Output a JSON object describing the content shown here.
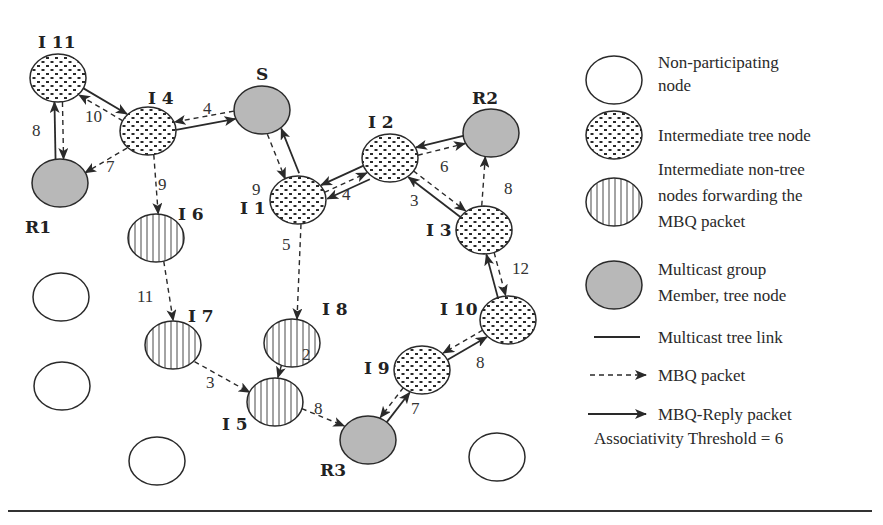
{
  "diagram": {
    "colors": {
      "stroke": "#2a2a2a",
      "member_fill": "#b8b8b8",
      "blank_fill": "#ffffff",
      "background": "#ffffff"
    },
    "nodes": [
      {
        "id": "I11",
        "label": "I 11",
        "type": "tree",
        "x": 58,
        "y": 78,
        "lx": 38,
        "ly": 48
      },
      {
        "id": "R1",
        "label": "R1",
        "type": "member",
        "x": 60,
        "y": 183,
        "lx": 25,
        "ly": 233
      },
      {
        "id": "I4",
        "label": "I 4",
        "type": "tree",
        "x": 148,
        "y": 131,
        "lx": 148,
        "ly": 104
      },
      {
        "id": "S",
        "label": "S",
        "type": "member",
        "x": 262,
        "y": 110,
        "lx": 256,
        "ly": 80
      },
      {
        "id": "I1",
        "label": "I 1",
        "type": "tree",
        "x": 298,
        "y": 200,
        "lx": 240,
        "ly": 214
      },
      {
        "id": "I2",
        "label": "I 2",
        "type": "tree",
        "x": 390,
        "y": 158,
        "lx": 368,
        "ly": 128
      },
      {
        "id": "R2",
        "label": "R2",
        "type": "member",
        "x": 491,
        "y": 133,
        "lx": 472,
        "ly": 104
      },
      {
        "id": "I3",
        "label": "I 3",
        "type": "tree",
        "x": 484,
        "y": 230,
        "lx": 426,
        "ly": 236
      },
      {
        "id": "I6",
        "label": "I 6",
        "type": "nontree",
        "x": 156,
        "y": 238,
        "lx": 178,
        "ly": 220
      },
      {
        "id": "I7",
        "label": "I 7",
        "type": "nontree",
        "x": 173,
        "y": 345,
        "lx": 188,
        "ly": 322
      },
      {
        "id": "I8",
        "label": "I 8",
        "type": "nontree",
        "x": 292,
        "y": 343,
        "lx": 322,
        "ly": 315
      },
      {
        "id": "I5",
        "label": "I 5",
        "type": "nontree",
        "x": 275,
        "y": 402,
        "lx": 222,
        "ly": 430
      },
      {
        "id": "I9",
        "label": "I 9",
        "type": "tree",
        "x": 422,
        "y": 370,
        "lx": 364,
        "ly": 374
      },
      {
        "id": "I10",
        "label": "I 10",
        "type": "tree",
        "x": 508,
        "y": 320,
        "lx": 440,
        "ly": 315
      },
      {
        "id": "R3",
        "label": "R3",
        "type": "member",
        "x": 368,
        "y": 440,
        "lx": 320,
        "ly": 476
      },
      {
        "id": "N1",
        "label": "",
        "type": "blank",
        "x": 61,
        "y": 297
      },
      {
        "id": "N2",
        "label": "",
        "type": "blank",
        "x": 62,
        "y": 386
      },
      {
        "id": "N3",
        "label": "",
        "type": "blank",
        "x": 157,
        "y": 461
      },
      {
        "id": "N4",
        "label": "",
        "type": "blank",
        "x": 497,
        "y": 457
      }
    ],
    "edges": [
      {
        "from": "I11",
        "to": "R1",
        "kind": "mbq",
        "label": "8",
        "lx": 32,
        "ly": 136
      },
      {
        "from": "R1",
        "to": "I11",
        "kind": "reply",
        "label": ""
      },
      {
        "from": "I11",
        "to": "I4",
        "kind": "reply",
        "label": ""
      },
      {
        "from": "I4",
        "to": "I11",
        "kind": "mbq",
        "label": "10",
        "lx": 85,
        "ly": 122
      },
      {
        "from": "S",
        "to": "I4",
        "kind": "mbq",
        "label": "4",
        "lx": 203,
        "ly": 114
      },
      {
        "from": "I4",
        "to": "S",
        "kind": "reply",
        "label": ""
      },
      {
        "from": "I4",
        "to": "R1",
        "kind": "mbq",
        "label": "7",
        "lx": 106,
        "ly": 172
      },
      {
        "from": "I4",
        "to": "I6",
        "kind": "mbq",
        "label": "9",
        "lx": 158,
        "ly": 190
      },
      {
        "from": "S",
        "to": "I1",
        "kind": "mbq",
        "label": "9",
        "lx": 252,
        "ly": 195
      },
      {
        "from": "I1",
        "to": "S",
        "kind": "reply2",
        "label": ""
      },
      {
        "from": "I2",
        "to": "I1",
        "kind": "reply",
        "label": ""
      },
      {
        "from": "I1",
        "to": "I2",
        "kind": "mbq",
        "label": "4",
        "lx": 342,
        "ly": 200
      },
      {
        "from": "I2",
        "to": "I1",
        "kind": "reply",
        "label": ""
      },
      {
        "from": "R2",
        "to": "I2",
        "kind": "reply",
        "label": ""
      },
      {
        "from": "I2",
        "to": "R2",
        "kind": "mbq",
        "label": "6",
        "lx": 440,
        "ly": 172
      },
      {
        "from": "I2",
        "to": "I3",
        "kind": "mbq",
        "label": "3",
        "lx": 410,
        "ly": 206
      },
      {
        "from": "I3",
        "to": "I2",
        "kind": "reply",
        "label": ""
      },
      {
        "from": "I3",
        "to": "R2",
        "kind": "mbq",
        "label": "8",
        "lx": 504,
        "ly": 194
      },
      {
        "from": "I10",
        "to": "I3",
        "kind": "reply",
        "label": ""
      },
      {
        "from": "I3",
        "to": "I10",
        "kind": "mbq",
        "label": "12",
        "lx": 512,
        "ly": 274
      },
      {
        "from": "I1",
        "to": "I8",
        "kind": "mbq",
        "label": "5",
        "lx": 282,
        "ly": 250
      },
      {
        "from": "I6",
        "to": "I7",
        "kind": "mbq",
        "label": "11",
        "lx": 137,
        "ly": 302
      },
      {
        "from": "I7",
        "to": "I5",
        "kind": "mbq",
        "label": "3",
        "lx": 206,
        "ly": 388
      },
      {
        "from": "I8",
        "to": "I5",
        "kind": "mbq",
        "label": "2",
        "lx": 302,
        "ly": 360
      },
      {
        "from": "I5",
        "to": "R3",
        "kind": "mbq",
        "label": "8",
        "lx": 314,
        "ly": 414
      },
      {
        "from": "R3",
        "to": "I9",
        "kind": "reply",
        "label": ""
      },
      {
        "from": "I9",
        "to": "R3",
        "kind": "mbq",
        "label": "7",
        "lx": 411,
        "ly": 414
      },
      {
        "from": "I9",
        "to": "I10",
        "kind": "reply",
        "label": ""
      },
      {
        "from": "I10",
        "to": "I9",
        "kind": "mbq",
        "label": "8",
        "lx": 476,
        "ly": 368
      }
    ]
  },
  "legend": {
    "items": [
      {
        "symbol": "blank",
        "lines": [
          "Non-participating",
          "node"
        ]
      },
      {
        "symbol": "tree",
        "lines": [
          "Intermediate tree node"
        ]
      },
      {
        "symbol": "nontree",
        "lines": [
          "Intermediate non-tree",
          "nodes forwarding the",
          "MBQ packet"
        ]
      },
      {
        "symbol": "member",
        "lines": [
          "Multicast group",
          "Member, tree node"
        ]
      },
      {
        "symbol": "tree-link",
        "lines": [
          "Multicast tree link"
        ]
      },
      {
        "symbol": "mbq",
        "lines": [
          "MBQ packet"
        ]
      },
      {
        "symbol": "reply",
        "lines": [
          "MBQ-Reply packet"
        ]
      }
    ],
    "threshold_text": "Associativity Threshold = 6"
  }
}
